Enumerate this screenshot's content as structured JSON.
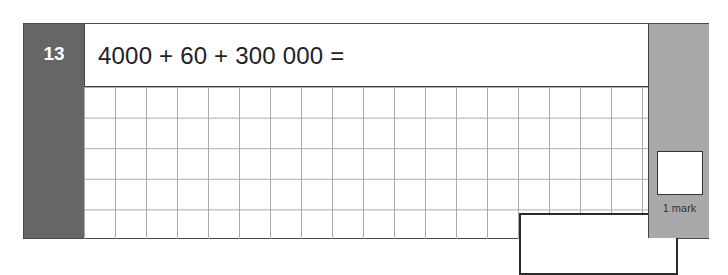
{
  "question": {
    "number": "13",
    "prompt": "4000 + 60 + 300 000 =",
    "answer_value": "",
    "marks_label": "1 mark"
  },
  "colors": {
    "number_panel": "#666666",
    "mark_panel": "#a9a9a9",
    "grid_lines": "#aaaaaa",
    "border": "#444444"
  },
  "grid": {
    "columns": 18,
    "rows": 5,
    "cell_size_px": 31
  }
}
